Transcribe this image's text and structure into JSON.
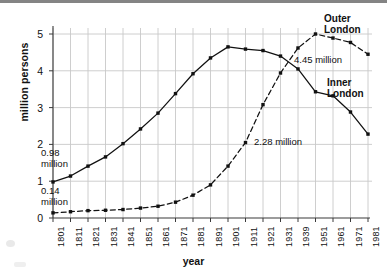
{
  "chart_data": {
    "type": "line",
    "title": "",
    "subtitle": "",
    "xlabel": "year",
    "ylabel": "million persons",
    "xlim": [
      0,
      18
    ],
    "ylim": [
      0,
      5
    ],
    "y_ticks": [
      "0",
      "1",
      "2",
      "3",
      "4",
      "5"
    ],
    "grid": true,
    "legend_position": "inline-labels",
    "categories": [
      "1801",
      "1811",
      "1821",
      "1831",
      "1841",
      "1851",
      "1861",
      "1871",
      "1881",
      "1891",
      "1901",
      "1911",
      "1921",
      "1931",
      "1939",
      "1951",
      "1961",
      "1971",
      "1981"
    ],
    "series": [
      {
        "name": "Inner London",
        "style": "solid",
        "marker": "square",
        "values": [
          0.98,
          1.14,
          1.41,
          1.66,
          2.02,
          2.42,
          2.85,
          3.38,
          3.92,
          4.35,
          4.65,
          4.59,
          4.55,
          4.4,
          4.05,
          3.43,
          3.32,
          2.88,
          2.28
        ]
      },
      {
        "name": "Outer London",
        "style": "dashed",
        "marker": "square",
        "values": [
          0.14,
          0.17,
          0.2,
          0.21,
          0.23,
          0.27,
          0.32,
          0.43,
          0.62,
          0.9,
          1.41,
          2.05,
          3.08,
          3.94,
          4.62,
          5.0,
          4.89,
          4.77,
          4.45
        ]
      }
    ],
    "annotations": [
      {
        "id": "inner-start",
        "text_line1": "0.98",
        "text_line2": "million"
      },
      {
        "id": "outer-start",
        "text_line1": "0.14",
        "text_line2": "million"
      },
      {
        "id": "outer-end-value",
        "text": "4.45 million"
      },
      {
        "id": "inner-end-value",
        "text": "2.28 million"
      },
      {
        "id": "outer-label",
        "text_line1": "Outer",
        "text_line2": "London"
      },
      {
        "id": "inner-label",
        "text_line1": "Inner",
        "text_line2": "London"
      }
    ],
    "colors": {
      "line": "#111111",
      "grid": "#c8c8c8",
      "axis": "#555555",
      "background": "#ffffff"
    }
  },
  "geometry": {
    "plot_left": 53,
    "plot_right": 368,
    "plot_top": 34,
    "plot_bottom": 218
  }
}
